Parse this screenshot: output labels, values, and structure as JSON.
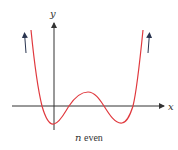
{
  "diagram": {
    "x_axis_label": "x",
    "y_axis_label": "y",
    "caption_var": "n",
    "caption_rest": " even",
    "colors": {
      "curve": "#e0393e",
      "axes": "#333333",
      "arrows": "#2a3550"
    }
  }
}
